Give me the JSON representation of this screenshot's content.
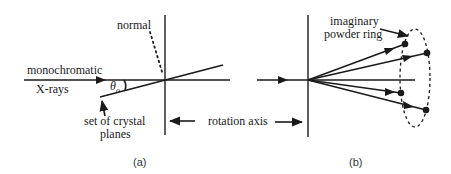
{
  "figure": {
    "panel_a": {
      "caption": "(a)",
      "labels": {
        "normal": "normal",
        "beam_line1": "monochromatic",
        "beam_line2": "X-rays",
        "angle": "θ",
        "angle_subscript": "o",
        "planes_line1": "set of crystal",
        "planes_line2": "planes"
      }
    },
    "shared": {
      "rotation_axis": "rotation axis"
    },
    "panel_b": {
      "caption": "(b)",
      "labels": {
        "ring_line1": "imaginary",
        "ring_line2": "powder ring"
      },
      "diffracted_rays": 4
    },
    "colors": {
      "ink": "#1a1a1a",
      "background": "#ffffff"
    }
  }
}
